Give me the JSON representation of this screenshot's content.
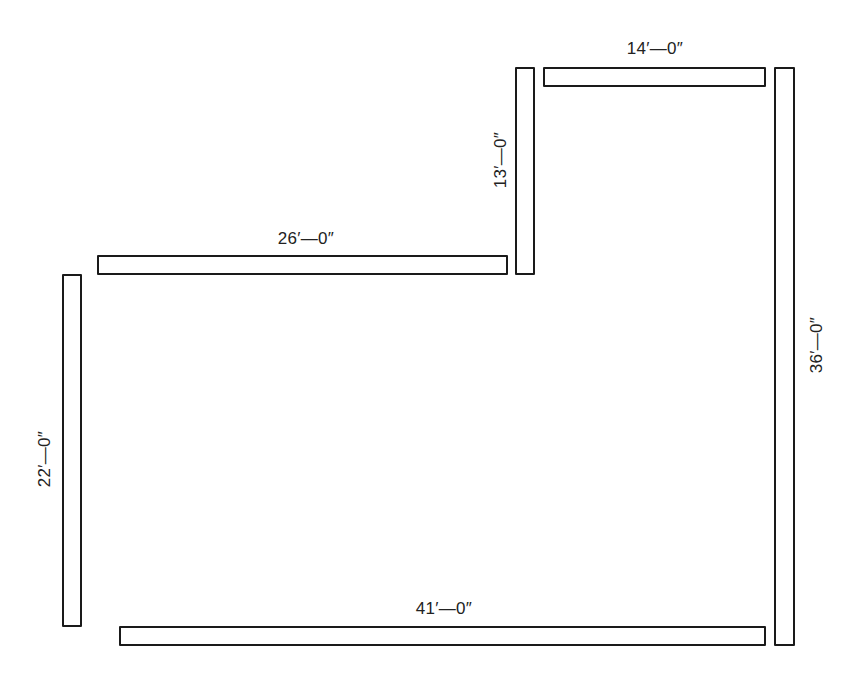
{
  "diagram": {
    "type": "floor-plan-walls",
    "background": "#ffffff",
    "stroke_color": "#1a1a1a",
    "walls": [
      {
        "id": "top-right",
        "orientation": "horizontal",
        "length_label": "14′—0″"
      },
      {
        "id": "inner-vertical",
        "orientation": "vertical",
        "length_label": "13′—0″"
      },
      {
        "id": "middle-horizontal",
        "orientation": "horizontal",
        "length_label": "26′—0″"
      },
      {
        "id": "left",
        "orientation": "vertical",
        "length_label": "22′—0″"
      },
      {
        "id": "bottom",
        "orientation": "horizontal",
        "length_label": "41′—0″"
      },
      {
        "id": "right",
        "orientation": "vertical",
        "length_label": "36′—0″"
      }
    ]
  }
}
